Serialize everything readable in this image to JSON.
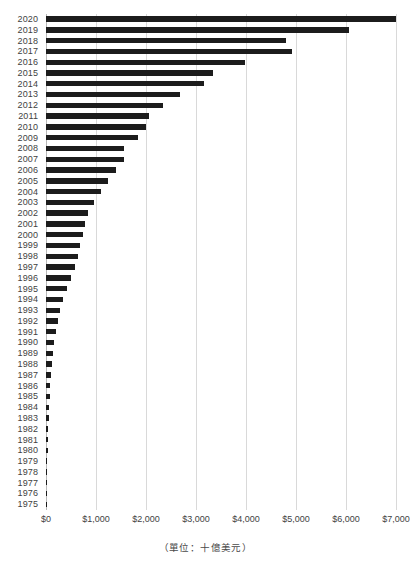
{
  "chart_data": {
    "type": "bar",
    "orientation": "horizontal",
    "title": "",
    "subtitle": "",
    "xlabel": "",
    "ylabel": "",
    "caption": "（單位：十億美元）",
    "grid": true,
    "legend": null,
    "xlim": [
      0,
      7000
    ],
    "x_ticks": [
      0,
      1000,
      2000,
      3000,
      4000,
      5000,
      6000,
      7000
    ],
    "x_tick_labels": [
      "$0",
      "$1,000",
      "$2,000",
      "$3,000",
      "$4,000",
      "$5,000",
      "$6,000",
      "$7,000"
    ],
    "categories": [
      "2020",
      "2019",
      "2018",
      "2017",
      "2016",
      "2015",
      "2014",
      "2013",
      "2012",
      "2011",
      "2010",
      "2009",
      "2008",
      "2007",
      "2006",
      "2005",
      "2004",
      "2003",
      "2002",
      "2001",
      "2000",
      "1999",
      "1998",
      "1997",
      "1996",
      "1995",
      "1994",
      "1993",
      "1992",
      "1991",
      "1990",
      "1989",
      "1988",
      "1987",
      "1986",
      "1985",
      "1984",
      "1983",
      "1982",
      "1981",
      "1980",
      "1979",
      "1978",
      "1977",
      "1976",
      "1975"
    ],
    "values": [
      7000,
      6060,
      4800,
      4920,
      3980,
      3340,
      3160,
      2670,
      2340,
      2060,
      1990,
      1830,
      1560,
      1560,
      1400,
      1230,
      1090,
      960,
      830,
      770,
      740,
      680,
      640,
      570,
      490,
      420,
      340,
      280,
      230,
      190,
      160,
      130,
      115,
      95,
      82,
      72,
      62,
      52,
      45,
      38,
      32,
      27,
      23,
      19,
      16,
      13
    ],
    "bar_color": "#1c1c1c",
    "grid_color": "#d9d9d9"
  }
}
